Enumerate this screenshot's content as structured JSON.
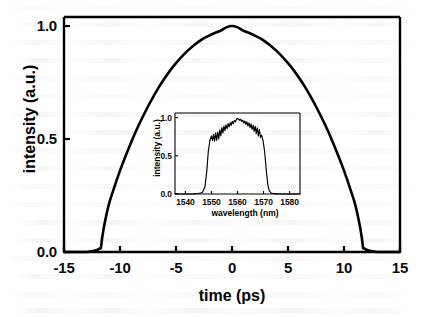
{
  "chart_data": [
    {
      "id": "main",
      "type": "line",
      "title": "",
      "xlabel": "time (ps)",
      "ylabel": "intensity (a.u.)",
      "xlim": [
        -15,
        15
      ],
      "ylim": [
        0.0,
        1.04
      ],
      "grid": false,
      "legend": "none",
      "xticks": [
        -15,
        -10,
        -5,
        0,
        5,
        10,
        15
      ],
      "xticklabels": [
        "-15",
        "-10",
        "-5",
        "0",
        "5",
        "10",
        "15"
      ],
      "yticks": [
        0.0,
        0.5,
        1.0
      ],
      "yticklabels": [
        "0.0",
        "0.5",
        "1.0"
      ],
      "line_color": "#000000",
      "description": "Parabolic flat-top pulse intensity profile, peak 1.0 at t = 0 ps, zero outside about -11.7 ps to +11.7 ps",
      "series": [
        {
          "name": "pulse intensity",
          "x": [
            -15.0,
            -14.0,
            -13.0,
            -12.4,
            -12.0,
            -11.8,
            -11.7,
            -11.6,
            -11.4,
            -11.0,
            -10.5,
            -10.0,
            -9.5,
            -9.0,
            -8.5,
            -8.0,
            -7.5,
            -7.0,
            -6.5,
            -6.0,
            -5.5,
            -5.0,
            -4.5,
            -4.0,
            -3.5,
            -3.0,
            -2.5,
            -2.0,
            -1.5,
            -1.0,
            -0.5,
            0.0,
            0.5,
            1.0,
            1.5,
            2.0,
            2.5,
            3.0,
            3.5,
            4.0,
            4.5,
            5.0,
            5.5,
            6.0,
            6.5,
            7.0,
            7.5,
            8.0,
            8.5,
            9.0,
            9.5,
            10.0,
            10.5,
            11.0,
            11.4,
            11.6,
            11.7,
            11.8,
            12.0,
            12.4,
            13.0,
            14.0,
            15.0
          ],
          "y": [
            0.0,
            0.0,
            0.0,
            0.004,
            0.01,
            0.016,
            0.02,
            0.06,
            0.12,
            0.21,
            0.288,
            0.36,
            0.425,
            0.486,
            0.543,
            0.595,
            0.644,
            0.69,
            0.732,
            0.77,
            0.805,
            0.836,
            0.864,
            0.889,
            0.911,
            0.93,
            0.946,
            0.959,
            0.97,
            0.98,
            0.994,
            1.0,
            0.994,
            0.98,
            0.97,
            0.959,
            0.946,
            0.93,
            0.911,
            0.889,
            0.864,
            0.836,
            0.805,
            0.77,
            0.732,
            0.69,
            0.644,
            0.595,
            0.543,
            0.486,
            0.425,
            0.36,
            0.288,
            0.21,
            0.12,
            0.06,
            0.02,
            0.016,
            0.01,
            0.004,
            0.0,
            0.0,
            0.0
          ]
        }
      ]
    },
    {
      "id": "inset",
      "type": "line",
      "title": "",
      "xlabel": "wavelength (nm)",
      "ylabel": "intensity (a.u.)",
      "xlim": [
        1536,
        1584
      ],
      "ylim": [
        0.0,
        1.06
      ],
      "grid": false,
      "legend": "none",
      "xticks": [
        1540,
        1550,
        1560,
        1570,
        1580
      ],
      "xticklabels": [
        "1540",
        "1550",
        "1560",
        "1570",
        "1580"
      ],
      "yticks": [
        0.0,
        0.5,
        1.0
      ],
      "yticklabels": [
        "0.0",
        "0.5",
        "1.0"
      ],
      "line_color": "#000000",
      "description": "Optical spectrum: flat-top band from about 1548 nm to 1572 nm centred near 1560 nm, with fine ripple modulation on the top and steep edges",
      "series": [
        {
          "name": "optical spectrum",
          "x": [
            1536.0,
            1540.0,
            1543.0,
            1545.0,
            1546.5,
            1547.5,
            1548.2,
            1548.8,
            1549.4,
            1550.0,
            1550.4,
            1550.8,
            1551.2,
            1551.6,
            1552.0,
            1552.4,
            1552.8,
            1553.2,
            1553.6,
            1554.0,
            1554.4,
            1554.8,
            1555.2,
            1555.6,
            1556.0,
            1556.4,
            1556.8,
            1557.2,
            1557.6,
            1558.0,
            1558.4,
            1558.8,
            1559.2,
            1559.6,
            1560.0,
            1560.4,
            1560.8,
            1561.2,
            1561.6,
            1562.0,
            1562.4,
            1562.8,
            1563.2,
            1563.6,
            1564.0,
            1564.4,
            1564.8,
            1565.2,
            1565.6,
            1566.0,
            1566.4,
            1566.8,
            1567.2,
            1567.6,
            1568.0,
            1568.4,
            1568.8,
            1569.2,
            1569.8,
            1570.4,
            1571.0,
            1571.6,
            1572.2,
            1573.0,
            1574.0,
            1576.0,
            1580.0,
            1584.0
          ],
          "y": [
            0.0,
            0.0,
            0.002,
            0.006,
            0.02,
            0.09,
            0.3,
            0.56,
            0.7,
            0.76,
            0.7,
            0.78,
            0.69,
            0.8,
            0.7,
            0.81,
            0.72,
            0.84,
            0.76,
            0.87,
            0.8,
            0.89,
            0.83,
            0.905,
            0.855,
            0.92,
            0.88,
            0.935,
            0.9,
            0.95,
            0.92,
            0.962,
            0.945,
            0.975,
            0.99,
            0.98,
            0.965,
            0.978,
            0.95,
            0.965,
            0.93,
            0.955,
            0.91,
            0.945,
            0.89,
            0.93,
            0.87,
            0.918,
            0.845,
            0.9,
            0.82,
            0.885,
            0.79,
            0.865,
            0.76,
            0.845,
            0.74,
            0.77,
            0.7,
            0.56,
            0.33,
            0.13,
            0.04,
            0.012,
            0.004,
            0.001,
            0.0,
            0.0
          ]
        }
      ]
    }
  ],
  "main_axis": {
    "y_title": "intensity (a.u.)",
    "x_title": "time (ps)",
    "y_ticks": [
      {
        "label": "1.0",
        "value": 1.0
      },
      {
        "label": "0.5",
        "value": 0.5
      },
      {
        "label": "0.0",
        "value": 0.0
      }
    ],
    "x_ticks": [
      {
        "label": "-15",
        "value": -15
      },
      {
        "label": "-10",
        "value": -10
      },
      {
        "label": "-5",
        "value": -5
      },
      {
        "label": "0",
        "value": 0
      },
      {
        "label": "5",
        "value": 5
      },
      {
        "label": "10",
        "value": 10
      },
      {
        "label": "15",
        "value": 15
      }
    ]
  },
  "inset_axis": {
    "y_title": "intensity (a.u.)",
    "x_title": "wavelength (nm)",
    "y_ticks": [
      {
        "label": "1.0",
        "value": 1.0
      },
      {
        "label": "0.5",
        "value": 0.5
      },
      {
        "label": "0.0",
        "value": 0.0
      }
    ],
    "x_ticks": [
      {
        "label": "1540",
        "value": 1540
      },
      {
        "label": "1550",
        "value": 1550
      },
      {
        "label": "1560",
        "value": 1560
      },
      {
        "label": "1570",
        "value": 1570
      },
      {
        "label": "1580",
        "value": 1580
      }
    ]
  },
  "style": {
    "background_color": "#ffffff",
    "line_color": "#000000",
    "frame_color": "#000000",
    "text_color": "#0b0b0b"
  }
}
